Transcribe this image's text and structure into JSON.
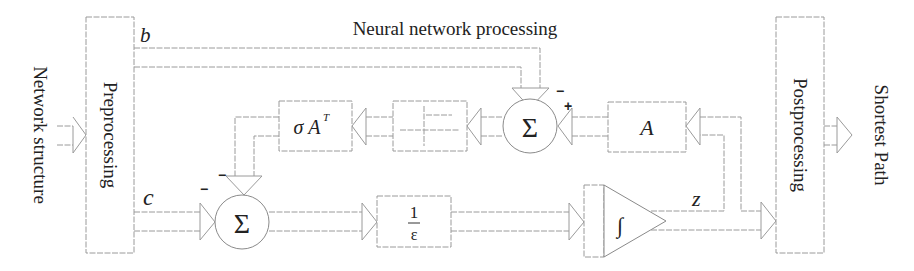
{
  "title": "Neural network processing",
  "input_label": "Network structure",
  "output_label": "Shortest Path",
  "blocks": {
    "preprocessing": "Preprocessing",
    "postprocessing": "Postprocessing",
    "sigma_at": {
      "base": "σ A",
      "superscript": "T"
    },
    "matrix_a": "A",
    "gain_numerator": "1",
    "gain_denominator": "ε",
    "integrator": "∫",
    "sum_symbol": "Σ"
  },
  "signals": {
    "b": "b",
    "c": "c",
    "z": "z"
  },
  "signs": {
    "sum1_top": "−",
    "sum1_right": "+",
    "sum2_top": "−",
    "sum2_left": "−"
  },
  "colors": {
    "line": "#9a9a9a",
    "text": "#222222",
    "background": "#ffffff"
  }
}
